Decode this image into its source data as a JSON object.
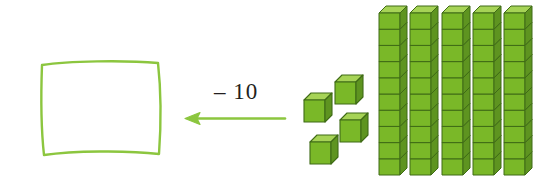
{
  "scene": {
    "width": 559,
    "height": 190,
    "background": "#ffffff",
    "description": "base-ten blocks subtraction model"
  },
  "answer_box": {
    "name": "empty answer box",
    "stroke_color": "#8cc63f",
    "stroke_width": 2,
    "x": 38,
    "y": 58,
    "width": 126,
    "height": 100
  },
  "operation": {
    "label": "– 10",
    "minus_sign": "–",
    "number": "10",
    "color": "#231f20",
    "x": 214,
    "y": 80
  },
  "arrow": {
    "direction": "left",
    "color": "#8cc63f",
    "x1": 285,
    "x2": 186,
    "y": 118
  },
  "blocks": {
    "unit_cubes": {
      "count": 4,
      "top_color": "#a6d356",
      "front_color": "#7ab828",
      "side_color": "#5e9420",
      "outline_color": "#3f6b16",
      "positions": [
        {
          "x": 334,
          "y": 74
        },
        {
          "x": 303,
          "y": 92
        },
        {
          "x": 339,
          "y": 112
        },
        {
          "x": 309,
          "y": 134
        }
      ]
    },
    "rods": {
      "count": 5,
      "cubes_per_rod": 10,
      "top_color": "#a6d356",
      "front_color": "#7ab828",
      "side_color": "#5e9420",
      "outline_color": "#3f6b16",
      "positions": [
        {
          "x": 378,
          "y": 5
        },
        {
          "x": 409,
          "y": 5
        },
        {
          "x": 441,
          "y": 5
        },
        {
          "x": 472,
          "y": 5
        },
        {
          "x": 503,
          "y": 5
        }
      ]
    },
    "total_value": 54
  },
  "chart_data": {
    "type": "diagram",
    "tens_rods": 5,
    "ones_cubes": 4,
    "depicted_total": 54,
    "operation": "– 10",
    "result_placeholder": "empty box"
  }
}
